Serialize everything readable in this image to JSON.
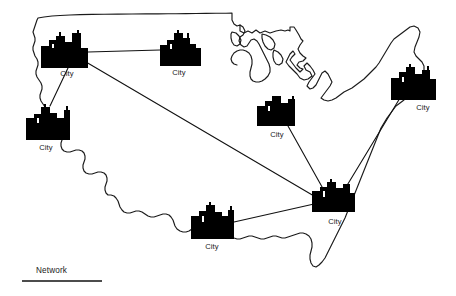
{
  "figure": {
    "background_color": "#ffffff",
    "ink_color": "#000000"
  },
  "legend": {
    "label": "Network",
    "rule_color": "#111111"
  },
  "cities": [
    {
      "id": "city-northwest",
      "label": "City",
      "node": [
        64,
        50
      ],
      "glyph_box": [
        40,
        32,
        49,
        36
      ],
      "label_pos": [
        67,
        74
      ]
    },
    {
      "id": "city-north-central",
      "label": "City",
      "node": [
        180,
        48
      ],
      "glyph_box": [
        159,
        31,
        42,
        35
      ],
      "label_pos": [
        179,
        73
      ]
    },
    {
      "id": "city-west",
      "label": "City",
      "node": [
        47,
        124
      ],
      "glyph_box": [
        25,
        106,
        45,
        34
      ],
      "label_pos": [
        46,
        148
      ]
    },
    {
      "id": "city-midwest",
      "label": "City",
      "node": [
        276,
        112
      ],
      "glyph_box": [
        256,
        96,
        42,
        32
      ],
      "label_pos": [
        277,
        135
      ]
    },
    {
      "id": "city-northeast",
      "label": "City",
      "node": [
        412,
        83
      ],
      "glyph_box": [
        390,
        66,
        47,
        34
      ],
      "label_pos": [
        423,
        108
      ]
    },
    {
      "id": "city-southeast",
      "label": "City",
      "node": [
        332,
        197
      ],
      "glyph_box": [
        311,
        181,
        44,
        33
      ],
      "label_pos": [
        335,
        222
      ]
    },
    {
      "id": "city-south",
      "label": "City",
      "node": [
        212,
        222
      ],
      "glyph_box": [
        190,
        205,
        44,
        34
      ],
      "label_pos": [
        212,
        247
      ]
    }
  ],
  "links": [
    {
      "id": "link-northwest-north-central",
      "from": "city-northwest",
      "to": "city-north-central"
    },
    {
      "id": "link-northwest-west",
      "from": "city-northwest",
      "to": "city-west"
    },
    {
      "id": "link-northwest-southeast",
      "from": "city-northwest",
      "to": "city-southeast"
    },
    {
      "id": "link-midwest-southeast",
      "from": "city-midwest",
      "to": "city-southeast"
    },
    {
      "id": "link-northeast-southeast",
      "from": "city-northeast",
      "to": "city-southeast"
    },
    {
      "id": "link-south-southeast",
      "from": "city-south",
      "to": "city-southeast"
    }
  ],
  "link_count": 6,
  "city_count": 7
}
